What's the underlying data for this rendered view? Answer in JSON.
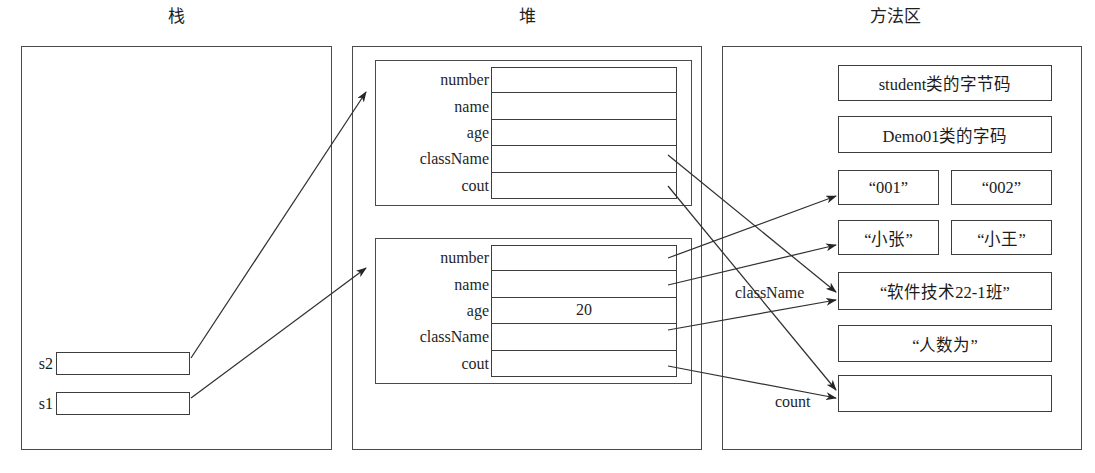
{
  "diagram": {
    "title_stack": "栈",
    "title_heap": "堆",
    "title_method_area": "方法区"
  },
  "stack": {
    "variables": [
      {
        "name": "s2",
        "value": ""
      },
      {
        "name": "s1",
        "value": ""
      }
    ]
  },
  "heap": {
    "objects": [
      {
        "fields": [
          {
            "label": "number",
            "value": ""
          },
          {
            "label": "name",
            "value": ""
          },
          {
            "label": "age",
            "value": ""
          },
          {
            "label": "className",
            "value": ""
          },
          {
            "label": "cout",
            "value": ""
          }
        ]
      },
      {
        "fields": [
          {
            "label": "number",
            "value": ""
          },
          {
            "label": "name",
            "value": ""
          },
          {
            "label": "age",
            "value": "20"
          },
          {
            "label": "className",
            "value": ""
          },
          {
            "label": "cout",
            "value": ""
          }
        ]
      }
    ]
  },
  "method_area": {
    "entries": [
      {
        "text": "student类的字节码",
        "span": "full"
      },
      {
        "text": "Demo01类的字码",
        "span": "full"
      },
      {
        "text": "“001”",
        "span": "left"
      },
      {
        "text": "“002”",
        "span": "right"
      },
      {
        "text": "“小张”",
        "span": "left"
      },
      {
        "text": "“小王”",
        "span": "right"
      },
      {
        "text": "“软件技术22-1班”",
        "span": "full"
      },
      {
        "text": "“人数为”",
        "span": "full"
      },
      {
        "text": "",
        "span": "full"
      }
    ]
  },
  "edge_labels": [
    {
      "text": "className"
    },
    {
      "text": "count"
    }
  ]
}
